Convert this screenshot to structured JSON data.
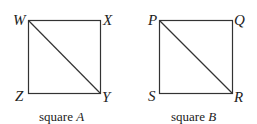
{
  "figure": {
    "squares": [
      {
        "id": "A",
        "caption_prefix": "square",
        "caption_letter": "A",
        "vertices": {
          "top_left": "W",
          "top_right": "X",
          "bottom_left": "Z",
          "bottom_right": "Y"
        },
        "diagonal": "WY"
      },
      {
        "id": "B",
        "caption_prefix": "square",
        "caption_letter": "B",
        "vertices": {
          "top_left": "P",
          "top_right": "Q",
          "bottom_left": "S",
          "bottom_right": "R"
        },
        "diagonal": "PR"
      }
    ],
    "line_color": "#333333"
  }
}
